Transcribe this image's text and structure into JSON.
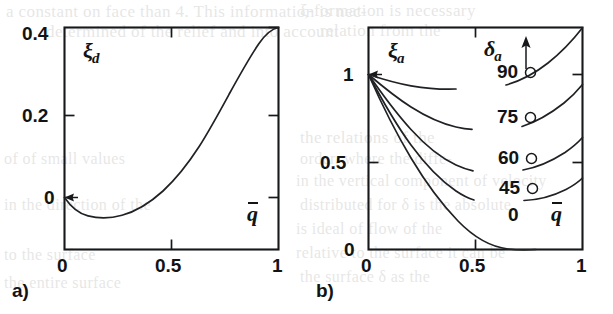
{
  "figure": {
    "kind": "two-panel-scientific-plot",
    "background_color": "#ffffff",
    "ink_color": "#16181a",
    "panels": [
      "a)",
      "b)"
    ]
  },
  "panel_a": {
    "id_label": "a)",
    "y_axis_symbol": "ξ",
    "y_axis_subscript": "d",
    "x_axis_symbol": "q",
    "x_axis_overbar": true,
    "y_ticks": [
      "0",
      "0.2",
      "0.4"
    ],
    "x_ticks": [
      "0",
      "0.5",
      "1"
    ]
  },
  "panel_b": {
    "id_label": "b)",
    "y_axis_symbol": "ξ",
    "y_axis_subscript": "a",
    "x_axis_symbol": "q",
    "x_axis_overbar": true,
    "y_ticks": [
      "0",
      "0.5",
      "1"
    ],
    "x_ticks": [
      "0",
      "0.5",
      "1"
    ],
    "parameter_symbol": "δ",
    "parameter_subscript": "a",
    "parameter_arrow": "up",
    "curve_labels": [
      "90○",
      "75○",
      "60○",
      "45○",
      "0"
    ],
    "curve_label_values": [
      "90",
      "75",
      "60",
      "45",
      "0"
    ],
    "degree_glyph": "○"
  },
  "bleed_text": {
    "lines": [
      {
        "text": "a constant on face than 4. This information is nec-",
        "x": 6,
        "y": 2,
        "size": 17
      },
      {
        "text": "determined of the relief and into account",
        "x": 46,
        "y": 22,
        "size": 17
      },
      {
        "text": "ξ-formation is necessary",
        "x": 300,
        "y": 1,
        "size": 17
      },
      {
        "text": "relation from the",
        "x": 320,
        "y": 21,
        "size": 17
      },
      {
        "text": "the relations of the",
        "x": 300,
        "y": 128,
        "size": 17
      },
      {
        "text": "order, where the diffe-",
        "x": 300,
        "y": 150,
        "size": 16
      },
      {
        "text": "in the vertical component of velocity",
        "x": 296,
        "y": 172,
        "size": 16
      },
      {
        "text": "distributed for  δ  is the absolute",
        "x": 300,
        "y": 196,
        "size": 16
      },
      {
        "text": "is ideal of flow of the",
        "x": 296,
        "y": 220,
        "size": 16
      },
      {
        "text": "relative to the surface it can be",
        "x": 296,
        "y": 244,
        "size": 16
      },
      {
        "text": "the surface  δ  as the",
        "x": 300,
        "y": 268,
        "size": 16
      },
      {
        "text": "of  of  small values",
        "x": 4,
        "y": 150,
        "size": 16
      },
      {
        "text": "in the direction of the",
        "x": 4,
        "y": 196,
        "size": 16
      },
      {
        "text": "to the surface",
        "x": 4,
        "y": 246,
        "size": 16
      },
      {
        "text": "the entire surface",
        "x": 4,
        "y": 274,
        "size": 16
      }
    ]
  },
  "chart_data": [
    {
      "panel": "a",
      "type": "line",
      "title": "",
      "xlabel": "q̄",
      "ylabel": "ξ_d",
      "xlim": [
        0,
        1
      ],
      "ylim": [
        -0.09,
        0.4
      ],
      "xticks": [
        0,
        0.5,
        1
      ],
      "yticks": [
        0,
        0.2,
        0.4
      ],
      "xticklabels": [
        "0",
        "0.5",
        "1"
      ],
      "yticklabels": [
        "0",
        "0.2",
        "0.4"
      ],
      "grid": false,
      "legend": "none",
      "series": [
        {
          "name": "xi_d",
          "x": [
            0.0,
            0.05,
            0.1,
            0.15,
            0.2,
            0.25,
            0.27,
            0.3,
            0.35,
            0.4,
            0.45,
            0.5,
            0.55,
            0.6,
            0.65,
            0.7,
            0.75,
            0.8,
            0.85,
            0.9,
            0.95,
            1.0
          ],
          "values": [
            0.0,
            -0.021,
            -0.035,
            -0.043,
            -0.047,
            -0.048,
            -0.048,
            -0.047,
            -0.043,
            -0.036,
            -0.026,
            -0.013,
            0.003,
            0.022,
            0.045,
            0.071,
            0.101,
            0.135,
            0.173,
            0.225,
            0.3,
            0.4
          ],
          "minimum": {
            "x": 0.27,
            "y": -0.048
          },
          "endpoint": {
            "x": 1.0,
            "y": 0.4
          },
          "startpoint": {
            "x": 0.0,
            "y": 0.0
          }
        }
      ],
      "annotations": [
        {
          "text": "ξ_d",
          "x": 0.1,
          "y": 0.34
        },
        {
          "text": "q̄",
          "x": 0.9,
          "y": 0.035
        }
      ]
    },
    {
      "panel": "b",
      "type": "line",
      "title": "",
      "xlabel": "q̄",
      "ylabel": "ξ_a",
      "xlim": [
        0,
        1
      ],
      "ylim": [
        0,
        1.17
      ],
      "xticks": [
        0,
        0.5,
        1
      ],
      "yticks": [
        0,
        0.5,
        1
      ],
      "xticklabels": [
        "0",
        "0.5",
        "1"
      ],
      "yticklabels": [
        "0",
        "0.5",
        "1"
      ],
      "grid": false,
      "legend": "inline-curve-labels",
      "parameter": "δ_a",
      "parameter_increases": "upward",
      "series": [
        {
          "name": "90°",
          "label": "90○",
          "x": [
            0.0,
            0.1,
            0.2,
            0.3,
            0.4,
            0.5,
            0.6,
            0.7,
            0.8,
            0.9,
            1.0
          ],
          "values": [
            1.0,
            0.98,
            0.962,
            0.948,
            0.938,
            0.932,
            0.932,
            0.94,
            0.962,
            1.01,
            1.11
          ]
        },
        {
          "name": "75°",
          "label": "75○",
          "x": [
            0.0,
            0.1,
            0.2,
            0.3,
            0.4,
            0.5,
            0.6,
            0.7,
            0.8,
            0.9,
            1.0
          ],
          "values": [
            1.0,
            0.935,
            0.88,
            0.836,
            0.802,
            0.776,
            0.762,
            0.758,
            0.77,
            0.81,
            0.895
          ]
        },
        {
          "name": "60°",
          "label": "60○",
          "x": [
            0.0,
            0.1,
            0.2,
            0.3,
            0.4,
            0.5,
            0.6,
            0.7,
            0.8,
            0.9,
            1.0
          ],
          "values": [
            1.0,
            0.88,
            0.78,
            0.7,
            0.636,
            0.588,
            0.556,
            0.542,
            0.55,
            0.59,
            0.68
          ]
        },
        {
          "name": "45°",
          "label": "45○",
          "x": [
            0.0,
            0.1,
            0.2,
            0.3,
            0.4,
            0.5,
            0.6,
            0.7,
            0.8,
            0.9,
            1.0
          ],
          "values": [
            1.0,
            0.838,
            0.7,
            0.585,
            0.492,
            0.418,
            0.362,
            0.328,
            0.316,
            0.34,
            0.43
          ]
        },
        {
          "name": "0°",
          "label": "0",
          "x": [
            0.0,
            0.1,
            0.2,
            0.3,
            0.4,
            0.5,
            0.6,
            0.7,
            0.8,
            0.9,
            0.95,
            1.0
          ],
          "values": [
            1.0,
            0.808,
            0.64,
            0.494,
            0.37,
            0.266,
            0.18,
            0.11,
            0.055,
            0.014,
            0.003,
            0.0
          ]
        }
      ],
      "annotations": [
        {
          "text": "ξ_a",
          "x": 0.08,
          "y": 1.06
        },
        {
          "text": "δ_a ↑",
          "x": 0.46,
          "y": 1.08
        },
        {
          "text": "q̄",
          "x": 0.9,
          "y": 0.14
        }
      ]
    }
  ]
}
